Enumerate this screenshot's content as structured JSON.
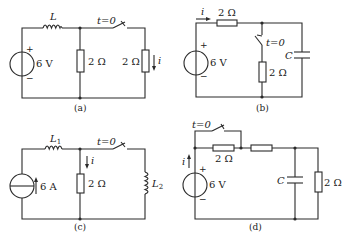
{
  "figure": {
    "panels": [
      {
        "id": "a",
        "caption": "(a)",
        "source": {
          "type": "voltage",
          "label": "6 V",
          "plus": "+",
          "minus": "−"
        },
        "inductor": {
          "label": "L"
        },
        "middle_resistor": {
          "label": "2 Ω"
        },
        "switch": {
          "label": "t=0",
          "state": "closing"
        },
        "right_resistor": {
          "label": "2 Ω"
        },
        "current": {
          "label": "i",
          "direction": "down"
        }
      },
      {
        "id": "b",
        "caption": "(b)",
        "source": {
          "type": "voltage",
          "label": "6 V",
          "plus": "+",
          "minus": "−"
        },
        "series_resistor": {
          "label": "2 Ω"
        },
        "current": {
          "label": "i",
          "direction": "right"
        },
        "switch": {
          "label": "t=0",
          "state": "closing"
        },
        "branch_resistor": {
          "label": "2 Ω"
        },
        "capacitor": {
          "label": "C"
        }
      },
      {
        "id": "c",
        "caption": "(c)",
        "source": {
          "type": "current",
          "label": "6 A"
        },
        "inductor1": {
          "label": "L",
          "sub": "1"
        },
        "middle_resistor": {
          "label": "2 Ω"
        },
        "current": {
          "label": "i",
          "direction": "down"
        },
        "switch": {
          "label": "t=0",
          "state": "closing"
        },
        "inductor2": {
          "label": "L",
          "sub": "2"
        }
      },
      {
        "id": "d",
        "caption": "(d)",
        "source": {
          "type": "voltage",
          "label": "6 V",
          "plus": "+",
          "minus": "−"
        },
        "current": {
          "label": "i",
          "direction": "up"
        },
        "switch": {
          "label": "t=0",
          "state": "closing"
        },
        "resistor1": {
          "label": "2 Ω"
        },
        "resistor2": {
          "label": ""
        },
        "capacitor": {
          "label": "C"
        },
        "right_resistor": {
          "label": "2 Ω"
        }
      }
    ]
  }
}
